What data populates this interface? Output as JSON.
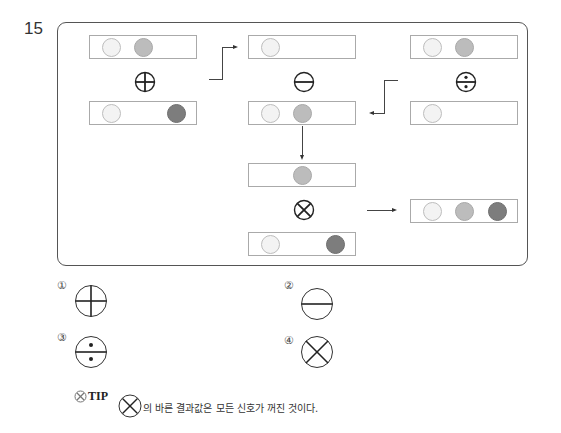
{
  "question": {
    "number": "15"
  },
  "diagram": {
    "operations": [
      {
        "symbol": "plus-circle",
        "input_top": [
          "off",
          "mid",
          "none"
        ],
        "input_bottom": [
          "off",
          "none",
          "dark"
        ]
      },
      {
        "symbol": "minus-circle",
        "input_top": [
          "off",
          "none",
          "none"
        ],
        "input_bottom": [
          "off",
          "mid",
          "none"
        ]
      },
      {
        "symbol": "divide-circle",
        "input_top": [
          "off",
          "mid",
          "none"
        ],
        "input_bottom": [
          "off",
          "none",
          "none"
        ]
      },
      {
        "symbol": "times-circle",
        "input_top": [
          "none",
          "mid",
          "none"
        ],
        "input_bottom": [
          "off",
          "none",
          "dark"
        ]
      }
    ],
    "result": [
      "off",
      "mid",
      "dark"
    ],
    "colors": {
      "off": "#f3f3f3",
      "mid": "#bcbcbc",
      "dark": "#7d7d7d"
    }
  },
  "choices": [
    {
      "label": "①",
      "symbol": "plus-circle"
    },
    {
      "label": "②",
      "symbol": "minus-circle"
    },
    {
      "label": "③",
      "symbol": "divide-circle"
    },
    {
      "label": "④",
      "symbol": "times-circle"
    }
  ],
  "tip": {
    "label": "TIP",
    "text": "의 바른 결과값은 모든 신호가 꺼진 것이다."
  }
}
